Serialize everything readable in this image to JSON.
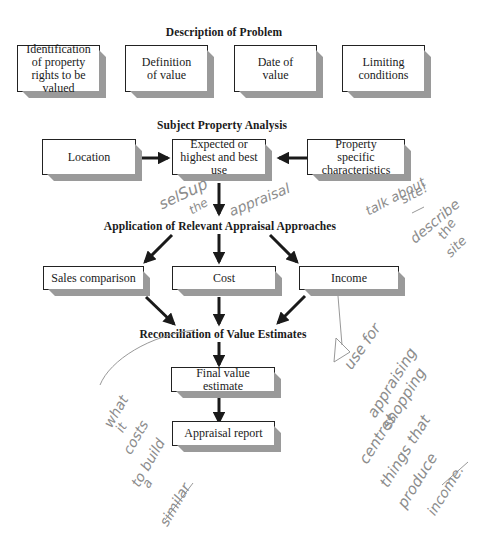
{
  "diagram": {
    "sections": {
      "description": "Description of Problem",
      "subject": "Subject Property Analysis",
      "application": "Application of Relevant Appraisal Approaches",
      "reconciliation": "Reconciliation of Value Estimates"
    },
    "description_boxes": [
      {
        "label": "Identification of property rights to be valued"
      },
      {
        "label": "Definition of value"
      },
      {
        "label": "Date of value"
      },
      {
        "label": "Limiting conditions"
      }
    ],
    "subject_boxes": {
      "location": "Location",
      "hbu": "Expected or highest and best use",
      "characteristics": "Property specific characteristics"
    },
    "approach_boxes": {
      "sales": "Sales comparison",
      "cost": "Cost",
      "income": "Income"
    },
    "final_boxes": {
      "final_value": "Final value estimate",
      "report": "Appraisal report"
    },
    "annotations": {
      "hbu_note": "select the appraisal",
      "site_note_1": "talk about site!",
      "site_note_2": "describe the site",
      "cost_note": "what it costs to build a similar",
      "income_note": "Use for appraising shopping centres things that produce income."
    },
    "colors": {
      "ink": "#1a1a1a",
      "box_shadow": "#9a9a9a",
      "pencil": "#8c8c8c"
    }
  }
}
